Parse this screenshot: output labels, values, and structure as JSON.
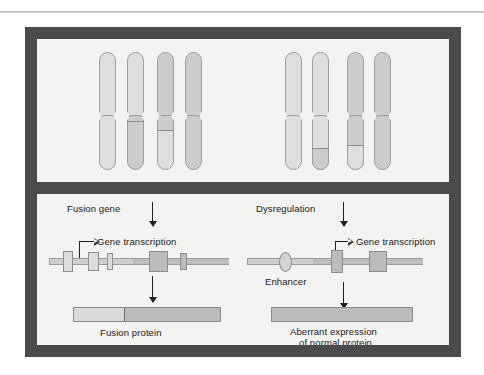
{
  "figure": {
    "frame_color": "#4b4b4b",
    "panel_bg": "#f3f3f1"
  },
  "top_panel": {
    "name": "chromosome-panel",
    "groups": [
      {
        "name": "translocation-group",
        "chromosomes": [
          {
            "label": "chromosome-1-normal",
            "upper_tone": "light",
            "lower_tone": "light",
            "band": false
          },
          {
            "label": "chromosome-2-derivative",
            "upper_tone": "light",
            "lower_tone": "mid",
            "band": true
          },
          {
            "label": "chromosome-3-derivative",
            "upper_tone": "mid",
            "lower_tone": "light",
            "band": true
          },
          {
            "label": "chromosome-4-normal",
            "upper_tone": "mid",
            "lower_tone": "mid",
            "band": false
          }
        ]
      },
      {
        "name": "dysregulation-group",
        "chromosomes": [
          {
            "label": "chromosome-5-normal",
            "upper_tone": "light",
            "lower_tone": "light",
            "band": false
          },
          {
            "label": "chromosome-6-derivative",
            "upper_tone": "light",
            "lower_tone": "mid",
            "band": true
          },
          {
            "label": "chromosome-7-derivative",
            "upper_tone": "mid",
            "lower_tone": "light",
            "band": true
          },
          {
            "label": "chromosome-8-normal",
            "upper_tone": "mid",
            "lower_tone": "mid",
            "band": false
          }
        ]
      }
    ]
  },
  "bottom_panel": {
    "name": "mechanism-panel",
    "left": {
      "heading": "Fusion gene",
      "transcription_label": "Gene transcription",
      "caption": "Fusion protein"
    },
    "right": {
      "heading": "Dysregulation",
      "transcription_label": "Gene transcription",
      "enhancer_label": "Enhancer",
      "caption_line1": "Aberrant expression",
      "caption_line2": "of normal protein"
    }
  }
}
